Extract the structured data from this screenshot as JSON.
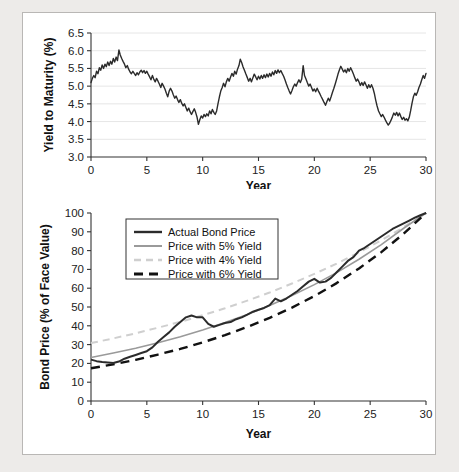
{
  "figure": {
    "background": "#edebe9",
    "panel_background": "#ffffff",
    "border_color": "#b9b7b5"
  },
  "chart_data": [
    {
      "type": "line",
      "id": "yield-to-maturity",
      "title": "",
      "xlabel": "Year",
      "ylabel": "Yield to Maturity (%)",
      "xlim": [
        0,
        30
      ],
      "ylim": [
        3.0,
        6.5
      ],
      "xticks": [
        "0",
        "5",
        "10",
        "15",
        "20",
        "25",
        "30"
      ],
      "yticks": [
        "3.0",
        "3.5",
        "4.0",
        "4.5",
        "5.0",
        "5.5",
        "6.0",
        "6.5"
      ],
      "grid": true,
      "legend": "none",
      "series": [
        {
          "name": "Yield to Maturity",
          "color": "#2b2b2b",
          "style": "solid",
          "x": [
            0,
            0.12,
            0.25,
            0.37,
            0.5,
            0.62,
            0.75,
            0.87,
            1,
            1.12,
            1.25,
            1.37,
            1.5,
            1.62,
            1.75,
            1.87,
            2,
            2.12,
            2.25,
            2.37,
            2.5,
            2.62,
            2.75,
            2.87,
            3,
            3.12,
            3.25,
            3.37,
            3.5,
            3.62,
            3.75,
            3.87,
            4,
            4.12,
            4.25,
            4.37,
            4.5,
            4.62,
            4.75,
            4.87,
            5,
            5.12,
            5.25,
            5.37,
            5.5,
            5.62,
            5.75,
            5.87,
            6,
            6.12,
            6.25,
            6.37,
            6.5,
            6.62,
            6.75,
            6.87,
            7,
            7.12,
            7.25,
            7.37,
            7.5,
            7.62,
            7.75,
            7.87,
            8,
            8.12,
            8.25,
            8.37,
            8.5,
            8.62,
            8.75,
            8.87,
            9,
            9.12,
            9.25,
            9.37,
            9.5,
            9.62,
            9.75,
            9.87,
            10,
            10.12,
            10.25,
            10.37,
            10.5,
            10.62,
            10.75,
            10.87,
            11,
            11.12,
            11.25,
            11.37,
            11.5,
            11.62,
            11.75,
            11.87,
            12,
            12.12,
            12.25,
            12.37,
            12.5,
            12.62,
            12.75,
            12.87,
            13,
            13.12,
            13.25,
            13.37,
            13.5,
            13.62,
            13.75,
            13.87,
            14,
            14.12,
            14.25,
            14.37,
            14.5,
            14.62,
            14.75,
            14.87,
            15,
            15.12,
            15.25,
            15.37,
            15.5,
            15.62,
            15.75,
            15.87,
            16,
            16.12,
            16.25,
            16.37,
            16.5,
            16.62,
            16.75,
            16.87,
            17,
            17.12,
            17.25,
            17.37,
            17.5,
            17.62,
            17.75,
            17.87,
            18,
            18.12,
            18.25,
            18.37,
            18.5,
            18.62,
            18.75,
            18.87,
            19,
            19.12,
            19.25,
            19.37,
            19.5,
            19.62,
            19.75,
            19.87,
            20,
            20.12,
            20.25,
            20.37,
            20.5,
            20.62,
            20.75,
            20.87,
            21,
            21.12,
            21.25,
            21.37,
            21.5,
            21.62,
            21.75,
            21.87,
            22,
            22.12,
            22.25,
            22.37,
            22.5,
            22.62,
            22.75,
            22.87,
            23,
            23.12,
            23.25,
            23.37,
            23.5,
            23.62,
            23.75,
            23.87,
            24,
            24.12,
            24.25,
            24.37,
            24.5,
            24.62,
            24.75,
            24.87,
            25,
            25.12,
            25.25,
            25.37,
            25.5,
            25.62,
            25.75,
            25.87,
            26,
            26.12,
            26.25,
            26.37,
            26.5,
            26.62,
            26.75,
            26.87,
            27,
            27.12,
            27.25,
            27.37,
            27.5,
            27.62,
            27.75,
            27.87,
            28,
            28.12,
            28.25,
            28.37,
            28.5,
            28.62,
            28.75,
            28.87,
            29,
            29.12,
            29.25,
            29.37,
            29.5,
            29.62,
            29.75,
            29.87,
            30
          ],
          "y": [
            5.1,
            5.22,
            5.3,
            5.24,
            5.42,
            5.35,
            5.52,
            5.45,
            5.6,
            5.5,
            5.62,
            5.55,
            5.68,
            5.58,
            5.7,
            5.62,
            5.78,
            5.68,
            5.82,
            5.72,
            6.02,
            5.88,
            5.78,
            5.7,
            5.62,
            5.52,
            5.58,
            5.48,
            5.4,
            5.35,
            5.42,
            5.36,
            5.3,
            5.38,
            5.32,
            5.4,
            5.45,
            5.38,
            5.44,
            5.36,
            5.42,
            5.34,
            5.26,
            5.18,
            5.3,
            5.2,
            5.12,
            5.22,
            5.14,
            5.06,
            4.96,
            5.08,
            5.0,
            4.92,
            4.8,
            4.7,
            4.86,
            4.94,
            4.86,
            4.76,
            4.66,
            4.72,
            4.62,
            4.54,
            4.62,
            4.52,
            4.44,
            4.5,
            4.4,
            4.3,
            4.38,
            4.28,
            4.2,
            4.28,
            4.36,
            4.26,
            4.12,
            3.92,
            4.06,
            4.16,
            4.1,
            4.2,
            4.14,
            4.22,
            4.16,
            4.3,
            4.22,
            4.34,
            4.26,
            4.2,
            4.3,
            4.5,
            4.7,
            4.86,
            4.96,
            5.08,
            4.98,
            5.12,
            5.22,
            5.14,
            5.26,
            5.36,
            5.28,
            5.42,
            5.34,
            5.48,
            5.58,
            5.76,
            5.66,
            5.54,
            5.44,
            5.34,
            5.24,
            5.14,
            5.22,
            5.12,
            5.24,
            5.34,
            5.26,
            5.18,
            5.28,
            5.2,
            5.3,
            5.22,
            5.32,
            5.24,
            5.34,
            5.26,
            5.36,
            5.28,
            5.4,
            5.32,
            5.44,
            5.36,
            5.46,
            5.38,
            5.44,
            5.36,
            5.28,
            5.18,
            5.06,
            4.96,
            4.86,
            4.78,
            4.88,
            4.98,
            5.06,
            5.0,
            5.1,
            5.18,
            5.1,
            5.2,
            5.58,
            5.3,
            5.2,
            5.1,
            5.0,
            5.06,
            4.96,
            4.86,
            4.92,
            4.84,
            4.94,
            4.86,
            4.78,
            4.7,
            4.62,
            4.54,
            4.46,
            4.56,
            4.66,
            4.58,
            4.7,
            4.82,
            4.94,
            5.06,
            5.2,
            5.34,
            5.46,
            5.56,
            5.48,
            5.4,
            5.46,
            5.38,
            5.5,
            5.42,
            5.52,
            5.44,
            5.34,
            5.24,
            5.14,
            5.2,
            5.12,
            5.02,
            5.1,
            5.02,
            5.12,
            5.04,
            4.94,
            5.04,
            4.96,
            5.04,
            4.94,
            4.8,
            4.6,
            4.44,
            4.3,
            4.22,
            4.14,
            4.2,
            4.12,
            4.04,
            3.96,
            3.9,
            3.96,
            4.04,
            4.14,
            4.24,
            4.18,
            4.26,
            4.16,
            4.24,
            4.14,
            4.06,
            4.12,
            4.04,
            4.08,
            4.02,
            4.12,
            4.3,
            4.52,
            4.7,
            4.8,
            4.74,
            4.84,
            4.96,
            5.06,
            5.18,
            5.3,
            5.22,
            5.36,
            5.48,
            5.6,
            5.72,
            5.62,
            5.52,
            5.42,
            5.5,
            5.4,
            5.32,
            5.24,
            5.34,
            5.26,
            5.18,
            5.26,
            5.36,
            5.48,
            5.58
          ]
        }
      ]
    },
    {
      "type": "line",
      "id": "bond-price",
      "title": "",
      "xlabel": "Year",
      "ylabel": "Bond Price (% of Face Value)",
      "xlim": [
        0,
        30
      ],
      "ylim": [
        0,
        100
      ],
      "xticks": [
        "0",
        "5",
        "10",
        "15",
        "20",
        "25",
        "30"
      ],
      "yticks": [
        "0",
        "10",
        "20",
        "30",
        "40",
        "50",
        "60",
        "70",
        "80",
        "90",
        "100"
      ],
      "grid": false,
      "legend": "upper left",
      "series": [
        {
          "name": "Actual Bond Price",
          "color": "#2b2b2b",
          "style": "solid",
          "width": 2,
          "x": [
            0,
            0.5,
            1,
            1.5,
            2,
            2.5,
            3,
            3.5,
            4,
            4.5,
            5,
            5.5,
            6,
            6.5,
            7,
            7.5,
            8,
            8.5,
            9,
            9.5,
            10,
            10.5,
            11,
            11.5,
            12,
            12.5,
            13,
            13.5,
            14,
            14.5,
            15,
            15.5,
            16,
            16.5,
            17,
            17.5,
            18,
            18.5,
            19,
            19.5,
            20,
            20.5,
            21,
            21.5,
            22,
            22.5,
            23,
            23.5,
            24,
            24.5,
            25,
            25.5,
            26,
            26.5,
            27,
            27.5,
            28,
            28.5,
            29,
            29.5,
            30
          ],
          "y": [
            22.0,
            21.2,
            20.8,
            20.5,
            20.2,
            21.0,
            22.5,
            23.5,
            24.5,
            25.5,
            26.5,
            28.5,
            31.5,
            34.0,
            36.5,
            39.5,
            42.0,
            44.5,
            45.5,
            44.5,
            44.5,
            41.0,
            39.5,
            40.5,
            41.5,
            42.0,
            43.5,
            44.5,
            46.0,
            47.5,
            48.5,
            49.5,
            51.0,
            54.5,
            53.0,
            54.5,
            56.5,
            58.5,
            61.0,
            63.5,
            65.0,
            63.0,
            63.5,
            65.5,
            68.5,
            71.5,
            74.5,
            76.5,
            80.0,
            81.5,
            83.5,
            85.5,
            87.5,
            89.5,
            91.5,
            93.0,
            94.5,
            96.0,
            97.5,
            98.8,
            100.0
          ]
        },
        {
          "name": "Price with 5% Yield",
          "color": "#9a9a9a",
          "style": "solid",
          "width": 1.6,
          "x": [
            0,
            2,
            4,
            6,
            8,
            10,
            12,
            14,
            16,
            18,
            20,
            22,
            24,
            26,
            28,
            30
          ],
          "y": [
            23.1,
            25.5,
            28.1,
            31.0,
            34.2,
            37.8,
            41.7,
            46.0,
            50.8,
            56.1,
            61.9,
            68.3,
            75.4,
            83.2,
            91.9,
            100.0
          ]
        },
        {
          "name": "Price with 4% Yield",
          "color": "#cfcfcf",
          "style": "dashed",
          "width": 2,
          "x": [
            0,
            2,
            4,
            6,
            8,
            10,
            12,
            14,
            16,
            18,
            20,
            22,
            24,
            26,
            28,
            30
          ],
          "y": [
            30.8,
            33.3,
            36.0,
            39.0,
            42.1,
            45.6,
            49.3,
            53.4,
            57.7,
            62.5,
            67.6,
            73.1,
            79.0,
            85.5,
            92.5,
            100.0
          ]
        },
        {
          "name": "Price with 6% Yield",
          "color": "#111111",
          "style": "dashed",
          "width": 2.4,
          "x": [
            0,
            2,
            4,
            6,
            8,
            10,
            12,
            14,
            16,
            18,
            20,
            22,
            24,
            26,
            28,
            30
          ],
          "y": [
            17.4,
            19.5,
            21.9,
            24.7,
            27.7,
            31.2,
            35.0,
            39.4,
            44.2,
            49.7,
            55.8,
            62.7,
            70.5,
            79.2,
            89.0,
            100.0
          ]
        }
      ]
    }
  ]
}
